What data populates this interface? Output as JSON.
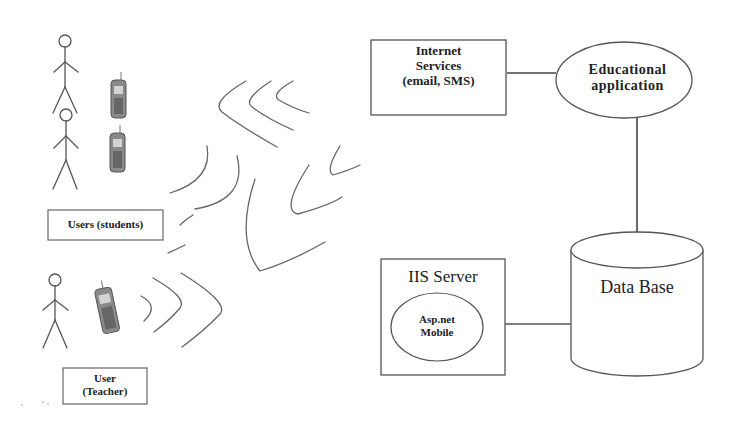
{
  "diagram": {
    "title": "",
    "nodes": {
      "students": {
        "label": "Users (students)"
      },
      "teacher": {
        "label_line1": "User",
        "label_line2": "(Teacher)"
      },
      "internet": {
        "label_line1": "Internet",
        "label_line2": "Services",
        "label_line3": "(email, SMS)"
      },
      "app": {
        "label_line1": "Educational",
        "label_line2": "application"
      },
      "database": {
        "label": "Data Base"
      },
      "iis": {
        "label": "IIS Server"
      },
      "aspnet": {
        "label_line1": "Asp.net",
        "label_line2": "Mobile"
      }
    },
    "edges": [
      {
        "from": "Internet Services",
        "to": "Educational application"
      },
      {
        "from": "Educational application",
        "to": "Data Base"
      },
      {
        "from": "IIS Server",
        "to": "Data Base"
      }
    ],
    "icons": [
      "stick-figure",
      "stick-figure",
      "stick-figure",
      "mobile-phone",
      "mobile-phone",
      "mobile-phone",
      "wireless-waves"
    ],
    "colors": {
      "stroke": "#555555",
      "text": "#222222",
      "background": "#ffffff",
      "phone": "#6a6a6a"
    }
  }
}
